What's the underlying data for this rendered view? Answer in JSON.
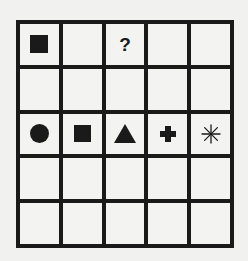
{
  "puzzle": {
    "rows": 5,
    "cols": 5,
    "question_mark": "?",
    "cells": [
      [
        "filled-square",
        "",
        "question",
        "",
        ""
      ],
      [
        "",
        "",
        "",
        "",
        ""
      ],
      [
        "filled-circle",
        "filled-square",
        "filled-triangle",
        "plus",
        "asterisk"
      ],
      [
        "",
        "",
        "",
        "",
        ""
      ],
      [
        "",
        "",
        "",
        "",
        ""
      ]
    ]
  },
  "colors": {
    "ink": "#1a1a1a",
    "paper": "#f3f3f1"
  }
}
